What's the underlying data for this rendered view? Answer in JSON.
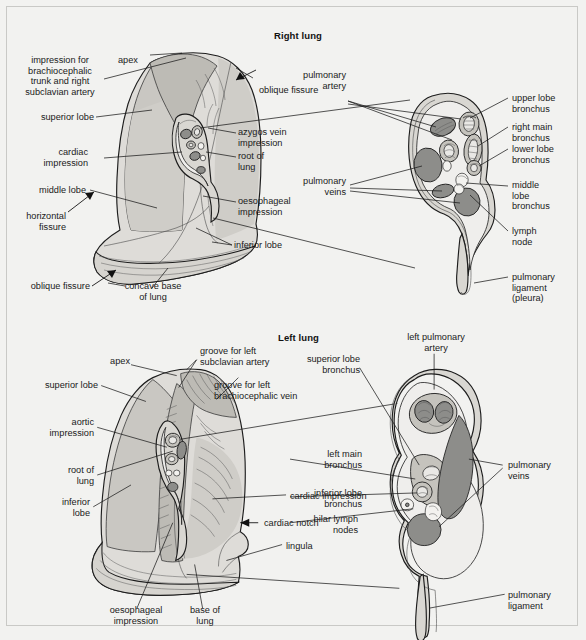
{
  "figure": {
    "background": "#f2f2f0",
    "ink": "#1a1a1a",
    "vessel_color": "#8d8d8a",
    "lung_fill": "#dedcd8"
  },
  "panels": [
    {
      "id": "right-lung",
      "title": "Right lung",
      "medial_labels": [
        "impression for\nbrachiocephalic\ntrunk and right\nsubclavian artery",
        "apex",
        "oblique fissure",
        "superior lobe",
        "azygos vein\nimpression",
        "cardiac\nimpression",
        "root of\nlung",
        "middle lobe",
        "oesophageal\nimpression",
        "horizontal\nfissure",
        "inferior lobe",
        "oblique fissure",
        "concave base\nof lung"
      ],
      "hilum_labels": [
        "pulmonary\nartery",
        "upper lobe\nbronchus",
        "right main\nbronchus",
        "lower lobe\nbronchus",
        "pulmonary\nveins",
        "middle\nlobe\nbronchus",
        "lymph\nnode",
        "pulmonary\nligament\n(pleura)"
      ]
    },
    {
      "id": "left-lung",
      "title": "Left lung",
      "medial_labels": [
        "apex",
        "groove for left\nsubclavian artery",
        "groove for left\nbrachiocephalic vein",
        "superior lobe",
        "aortic\nimpression",
        "root of\nlung",
        "inferior\nlobe",
        "cardiac impression",
        "cardiac notch",
        "lingula",
        "oesophageal\nimpression",
        "base of\nlung"
      ],
      "hilum_labels": [
        "left pulmonary\nartery",
        "superior lobe\nbronchus",
        "left main\nbronchus",
        "inferior lobe\nbronchus",
        "hilar lymph\nnodes",
        "pulmonary\nveins",
        "pulmonary\nligament"
      ]
    }
  ],
  "labels": {
    "rl_title": "Right lung",
    "rl_brachio": "impression for\nbrachiocephalic\ntrunk and right\nsubclavian artery",
    "rl_apex": "apex",
    "rl_oblique_fissure_top": "oblique fissure",
    "rl_superior_lobe": "superior lobe",
    "rl_azygos": "azygos vein\nimpression",
    "rl_cardiac": "cardiac\nimpression",
    "rl_root": "root of\nlung",
    "rl_middle_lobe": "middle lobe",
    "rl_oesophageal": "oesophageal\nimpression",
    "rl_horizontal_fissure": "horizontal\nfissure",
    "rl_inferior_lobe": "inferior lobe",
    "rl_oblique_fissure_bottom": "oblique fissure",
    "rl_concave_base": "concave base\nof lung",
    "rl_pulm_artery": "pulmonary\nartery",
    "rl_upper_lobe_bronchus": "upper lobe\nbronchus",
    "rl_right_main_bronchus": "right main\nbronchus",
    "rl_lower_lobe_bronchus": "lower lobe\nbronchus",
    "rl_pulm_veins": "pulmonary\nveins",
    "rl_middle_lobe_bronchus": "middle\nlobe\nbronchus",
    "rl_lymph_node": "lymph\nnode",
    "rl_pulm_ligament": "pulmonary\nligament\n(pleura)",
    "ll_title": "Left lung",
    "ll_apex": "apex",
    "ll_groove_subclavian": "groove for left\nsubclavian artery",
    "ll_groove_brachio": "groove for left\nbrachiocephalic vein",
    "ll_superior_lobe": "superior lobe",
    "ll_aortic": "aortic\nimpression",
    "ll_root": "root of\nlung",
    "ll_inferior_lobe": "inferior\nlobe",
    "ll_cardiac_impression": "cardiac impression",
    "ll_cardiac_notch": "cardiac notch",
    "ll_lingula": "lingula",
    "ll_oesophageal": "oesophageal\nimpression",
    "ll_base": "base of\nlung",
    "ll_left_pulm_artery": "left pulmonary\nartery",
    "ll_superior_lobe_bronchus": "superior lobe\nbronchus",
    "ll_left_main_bronchus": "left main\nbronchus",
    "ll_inferior_lobe_bronchus": "inferior lobe\nbronchus",
    "ll_hilar_nodes": "hilar lymph\nnodes",
    "ll_pulm_veins": "pulmonary\nveins",
    "ll_pulm_ligament": "pulmonary\nligament"
  }
}
